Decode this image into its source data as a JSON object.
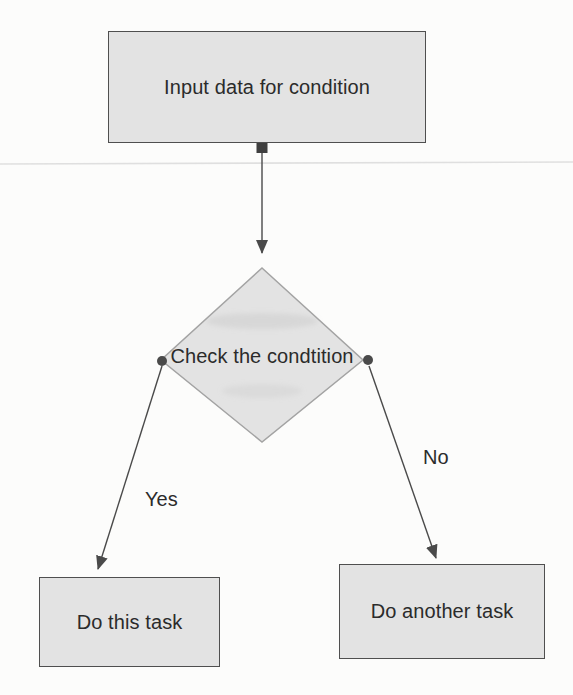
{
  "colors": {
    "canvas_bg": "#fcfcfb",
    "node_fill": "#e3e3e3",
    "node_border": "#4f4f4f",
    "diamond_border": "#a3a3a3",
    "connector": "#4a4a4a",
    "text": "#2b2b2b",
    "scan_line": "#d9d9d9"
  },
  "flowchart": {
    "nodes": [
      {
        "id": "input",
        "type": "process",
        "label": "Input data for condition"
      },
      {
        "id": "decision",
        "type": "decision",
        "label": "Check the condtition"
      },
      {
        "id": "yes-task",
        "type": "process",
        "label": "Do this task"
      },
      {
        "id": "no-task",
        "type": "process",
        "label": "Do another task"
      }
    ],
    "edges": [
      {
        "from": "input",
        "to": "decision",
        "label": ""
      },
      {
        "from": "decision",
        "to": "yes-task",
        "label": "Yes"
      },
      {
        "from": "decision",
        "to": "no-task",
        "label": "No"
      }
    ]
  }
}
